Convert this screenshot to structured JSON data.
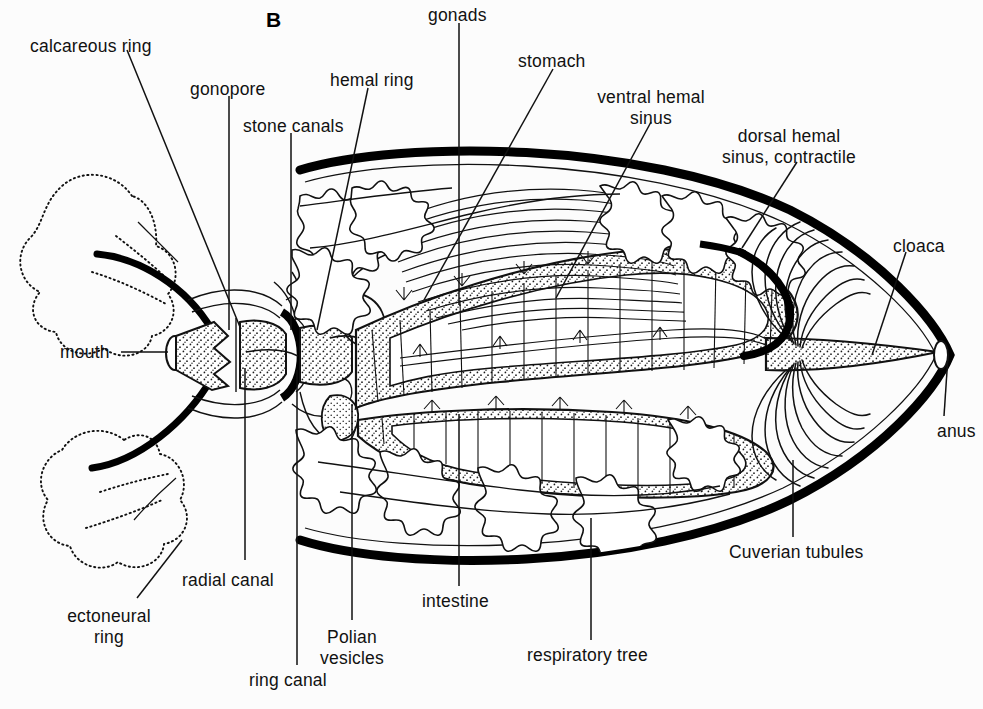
{
  "figure": {
    "panel_letter": "B",
    "background_color": "#fcfcfc",
    "ink_color": "#111111"
  },
  "labels": [
    {
      "id": "calcareous-ring",
      "text": "calcareous ring",
      "x": 30,
      "y": 36,
      "align": "left"
    },
    {
      "id": "gonopore",
      "text": "gonopore",
      "x": 190,
      "y": 79,
      "align": "left"
    },
    {
      "id": "stone-canals",
      "text": "stone canals",
      "x": 243,
      "y": 116,
      "align": "left"
    },
    {
      "id": "hemal-ring",
      "text": "hemal ring",
      "x": 330,
      "y": 70,
      "align": "left"
    },
    {
      "id": "gonads",
      "text": "gonads",
      "x": 428,
      "y": 5,
      "align": "left"
    },
    {
      "id": "stomach",
      "text": "stomach",
      "x": 518,
      "y": 51,
      "align": "left"
    },
    {
      "id": "ventral-hemal-sinus",
      "text": "ventral hemal\nsinus",
      "x": 601,
      "y": 87,
      "align": "center"
    },
    {
      "id": "dorsal-hemal-sinus",
      "text": "dorsal hemal\nsinus, contractile",
      "x": 720,
      "y": 126,
      "align": "center"
    },
    {
      "id": "cloaca",
      "text": "cloaca",
      "x": 893,
      "y": 236,
      "align": "left"
    },
    {
      "id": "anus",
      "text": "anus",
      "x": 937,
      "y": 421,
      "align": "left"
    },
    {
      "id": "mouth",
      "text": "mouth",
      "x": 60,
      "y": 342,
      "align": "left"
    },
    {
      "id": "cuverian-tubules",
      "text": "Cuverian tubules",
      "x": 729,
      "y": 542,
      "align": "left"
    },
    {
      "id": "respiratory-tree",
      "text": "respiratory tree",
      "x": 527,
      "y": 645,
      "align": "left"
    },
    {
      "id": "intestine",
      "text": "intestine",
      "x": 422,
      "y": 591,
      "align": "left"
    },
    {
      "id": "polian-vesicles",
      "text": "Polian\nvesicles",
      "x": 323,
      "y": 627,
      "align": "center"
    },
    {
      "id": "ring-canal",
      "text": "ring canal",
      "x": 249,
      "y": 670,
      "align": "left"
    },
    {
      "id": "radial-canal",
      "text": "radial canal",
      "x": 182,
      "y": 570,
      "align": "left"
    },
    {
      "id": "ectoneural-ring",
      "text": "ectoneural\nring",
      "x": 60,
      "y": 606,
      "align": "center"
    }
  ],
  "leaders": [
    {
      "id": "leader-calcareous-ring",
      "from": [
        127,
        50
      ],
      "to": [
        240,
        327
      ]
    },
    {
      "id": "leader-gonopore",
      "from": [
        229,
        96
      ],
      "to": [
        229,
        330
      ]
    },
    {
      "id": "leader-stone-canals",
      "from": [
        291,
        133
      ],
      "to": [
        291,
        330
      ]
    },
    {
      "id": "leader-hemal-ring",
      "from": [
        368,
        88
      ],
      "to": [
        317,
        330
      ]
    },
    {
      "id": "leader-gonads",
      "from": [
        459,
        23
      ],
      "to": [
        459,
        305
      ]
    },
    {
      "id": "leader-stomach",
      "from": [
        553,
        69
      ],
      "to": [
        424,
        300
      ]
    },
    {
      "id": "leader-ventral-hemal-sinus",
      "from": [
        651,
        122
      ],
      "to": [
        556,
        298
      ]
    },
    {
      "id": "leader-dorsal-hemal-sinus",
      "from": [
        797,
        162
      ],
      "to": [
        742,
        248
      ]
    },
    {
      "id": "leader-cloaca",
      "from": [
        906,
        252
      ],
      "to": [
        872,
        355
      ]
    },
    {
      "id": "leader-anus",
      "from": [
        944,
        416
      ],
      "to": [
        948,
        356
      ]
    },
    {
      "id": "leader-mouth",
      "from": [
        121,
        352
      ],
      "to": [
        168,
        352
      ]
    },
    {
      "id": "leader-cuverian-tubules",
      "from": [
        793,
        537
      ],
      "to": [
        793,
        460
      ]
    },
    {
      "id": "leader-respiratory-tree",
      "from": [
        591,
        640
      ],
      "to": [
        591,
        518
      ]
    },
    {
      "id": "leader-intestine",
      "from": [
        459,
        586
      ],
      "to": [
        459,
        414
      ]
    },
    {
      "id": "leader-polian-vesicles",
      "from": [
        352,
        620
      ],
      "to": [
        352,
        404
      ]
    },
    {
      "id": "leader-ring-canal",
      "from": [
        297,
        665
      ],
      "to": [
        297,
        370
      ]
    },
    {
      "id": "leader-radial-canal",
      "from": [
        245,
        560
      ],
      "to": [
        245,
        368
      ]
    },
    {
      "id": "leader-ectoneural-ring",
      "from": [
        137,
        598
      ],
      "to": [
        182,
        540
      ]
    }
  ]
}
